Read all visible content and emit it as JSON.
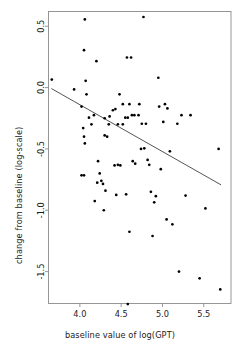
{
  "chart_data": {
    "type": "scatter",
    "title": "",
    "xlabel": "baseline value of log(GPT)",
    "ylabel": "change from baseline (log-scale)",
    "xlim": [
      3.62,
      5.83
    ],
    "ylim": [
      -1.76,
      0.62
    ],
    "xticks": [
      4.0,
      4.5,
      5.0,
      5.5
    ],
    "xticklabels": [
      "4.0",
      "4.5",
      "5.0",
      "5.5"
    ],
    "yticks": [
      0.5,
      0.0,
      -0.5,
      -1.0,
      -1.5
    ],
    "yticklabels": [
      "0.5",
      "0.0",
      "-0.5",
      "-1.0",
      "-1.5"
    ],
    "grid": false,
    "legend": null,
    "marker": {
      "shape": "circle",
      "color": "#000000",
      "size_px": 2.0
    },
    "trend_line": {
      "kind": "linear-regression",
      "color": "#555555",
      "x_start": 3.655,
      "y_start": -0.008,
      "x_end": 5.71,
      "y_end": -0.793,
      "slope": -0.382,
      "intercept": 1.389
    },
    "points": [
      [
        3.66,
        0.065
      ],
      [
        3.93,
        -0.015
      ],
      [
        4.02,
        -0.155
      ],
      [
        4.05,
        0.305
      ],
      [
        4.06,
        0.555
      ],
      [
        4.07,
        0.055
      ],
      [
        4.04,
        -0.33
      ],
      [
        4.05,
        -0.4
      ],
      [
        4.06,
        -0.455
      ],
      [
        4.02,
        -0.715
      ],
      [
        4.05,
        -0.715
      ],
      [
        4.08,
        -0.055
      ],
      [
        4.11,
        -0.245
      ],
      [
        4.14,
        -0.3
      ],
      [
        4.2,
        0.215
      ],
      [
        4.17,
        -0.225
      ],
      [
        4.22,
        -0.6
      ],
      [
        4.21,
        -0.775
      ],
      [
        4.18,
        -0.925
      ],
      [
        4.24,
        -0.7
      ],
      [
        4.26,
        -0.76
      ],
      [
        4.28,
        -0.785
      ],
      [
        4.31,
        -0.84
      ],
      [
        4.29,
        -1.0
      ],
      [
        4.3,
        -0.39
      ],
      [
        4.33,
        -0.4
      ],
      [
        4.3,
        -0.25
      ],
      [
        4.36,
        -0.235
      ],
      [
        4.35,
        -0.3
      ],
      [
        4.4,
        -0.185
      ],
      [
        4.43,
        -0.175
      ],
      [
        4.46,
        -0.3
      ],
      [
        4.42,
        -0.635
      ],
      [
        4.46,
        -0.63
      ],
      [
        4.49,
        -0.635
      ],
      [
        4.44,
        -0.875
      ],
      [
        4.48,
        -0.055
      ],
      [
        4.52,
        -0.135
      ],
      [
        4.52,
        -0.3
      ],
      [
        4.55,
        -0.245
      ],
      [
        4.58,
        -0.245
      ],
      [
        4.57,
        0.245
      ],
      [
        4.62,
        0.245
      ],
      [
        4.6,
        -0.135
      ],
      [
        4.63,
        -0.225
      ],
      [
        4.66,
        -0.225
      ],
      [
        4.64,
        -0.6
      ],
      [
        4.67,
        -0.62
      ],
      [
        4.58,
        -1.765
      ],
      [
        4.56,
        -0.87
      ],
      [
        4.6,
        -1.175
      ],
      [
        4.71,
        -0.225
      ],
      [
        4.72,
        -0.135
      ],
      [
        4.75,
        -0.295
      ],
      [
        4.74,
        -0.5
      ],
      [
        4.78,
        -0.495
      ],
      [
        4.77,
        0.575
      ],
      [
        4.8,
        -0.295
      ],
      [
        4.82,
        -0.59
      ],
      [
        4.84,
        -0.63
      ],
      [
        4.86,
        -0.85
      ],
      [
        4.88,
        -1.21
      ],
      [
        4.92,
        -0.885
      ],
      [
        4.9,
        -0.935
      ],
      [
        4.95,
        0.08
      ],
      [
        4.96,
        -0.155
      ],
      [
        4.98,
        -0.665
      ],
      [
        5.01,
        -0.28
      ],
      [
        5.03,
        -0.135
      ],
      [
        5.06,
        -0.17
      ],
      [
        5.05,
        -1.075
      ],
      [
        5.09,
        -0.52
      ],
      [
        5.12,
        -1.115
      ],
      [
        5.18,
        -0.295
      ],
      [
        5.2,
        -1.5
      ],
      [
        5.23,
        -0.225
      ],
      [
        5.28,
        -0.88
      ],
      [
        5.34,
        -0.225
      ],
      [
        5.45,
        -1.555
      ],
      [
        5.52,
        -0.985
      ],
      [
        5.68,
        -0.5
      ],
      [
        5.7,
        -1.645
      ]
    ]
  }
}
